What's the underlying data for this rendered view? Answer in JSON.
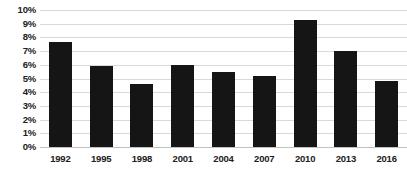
{
  "chart_data": {
    "type": "bar",
    "title": "",
    "subtitle": "",
    "xlabel": "",
    "ylabel": "",
    "categories": [
      "1992",
      "1995",
      "1998",
      "2001",
      "2004",
      "2007",
      "2010",
      "2013",
      "2016"
    ],
    "values": [
      7.7,
      5.9,
      4.6,
      6.0,
      5.5,
      5.2,
      9.3,
      7.0,
      4.8
    ],
    "ylim": [
      0,
      10
    ],
    "ytick_labels": [
      "10%",
      "9%",
      "8%",
      "7%",
      "6%",
      "5%",
      "4%",
      "3%",
      "2%",
      "1%",
      "0%"
    ],
    "ytick_values": [
      10,
      9,
      8,
      7,
      6,
      5,
      4,
      3,
      2,
      1,
      0
    ],
    "ytick_step": 1,
    "grid": true,
    "grid_axis": "y",
    "legend": false,
    "legend_position": "none",
    "series": [
      {
        "name": "",
        "values": [
          7.7,
          5.9,
          4.6,
          6.0,
          5.5,
          5.2,
          9.3,
          7.0,
          4.8
        ]
      }
    ],
    "bar_color": "#151515",
    "gridline_color": "#d9d9d9",
    "background_color": "#ffffff",
    "text_color": "#202020"
  }
}
